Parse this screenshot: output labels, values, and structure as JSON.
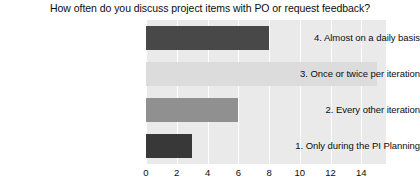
{
  "chart_data": {
    "type": "bar",
    "orientation": "horizontal",
    "title": "How often do you discuss project items with PO or request feedback?",
    "xlabel": "",
    "ylabel": "",
    "categories": [
      "4. Almost on a daily basis",
      "3. Once or twice per iteration",
      "2. Every other iteration",
      "1. Only during the PI Planning"
    ],
    "values": [
      8,
      15,
      6,
      3
    ],
    "bar_colors": [
      "#484848",
      "#dcdcdc",
      "#909090",
      "#383838"
    ],
    "xlim": [
      0,
      15.6
    ],
    "xticks": [
      0,
      2,
      4,
      6,
      8,
      10,
      12,
      14
    ],
    "xtick_labels": [
      "0",
      "2",
      "4",
      "6",
      "8",
      "10",
      "12",
      "14"
    ],
    "grid": true,
    "grid_color": "#ffffff",
    "plot_background": "#eaeaea",
    "legend": null
  }
}
